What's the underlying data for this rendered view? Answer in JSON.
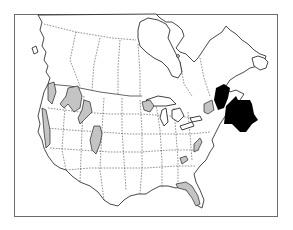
{
  "figure": {
    "type": "species-range-map",
    "region": "North America (Canada and United States)",
    "text_labels": [],
    "colors": {
      "background": "#ffffff",
      "frame": "#6b6b6b",
      "outline": "#1a1a1a",
      "range_fill": "#c4c4c4",
      "focal_fill": "#000000"
    },
    "frame": {
      "x": 14,
      "y": 14,
      "width": 264,
      "height": 203
    },
    "shaded_ranges": [
      "Pacific Northwest coast (Washington / Oregon)",
      "Sierra Nevada / Cascades (California)",
      "Northern Rockies (Idaho / Montana)",
      "Wyoming Rockies",
      "Colorado Rockies",
      "Western Great Lakes (Minnesota / Wisconsin / Ontario)",
      "Northern New England / Adirondacks",
      "Appalachians (Virginia / North Carolina)",
      "Tennessee",
      "Florida"
    ],
    "focal_region": "Maine / New Brunswick (solid black)",
    "arrow": {
      "direction": "points northwest toward Maine",
      "color": "#000000"
    }
  }
}
